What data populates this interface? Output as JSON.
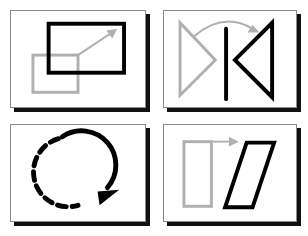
{
  "diagram": {
    "layout": "2x2 grid of framed panels with drop shadows",
    "colors": {
      "original": "#b0b0b0",
      "transformed": "#000000",
      "frame": "#8a8a8a",
      "shadow": "#111111",
      "background": "#ffffff"
    },
    "panels": [
      {
        "id": "translation",
        "description": "Gray rectangle moved up-right into black rectangle, gray arrow shows direction"
      },
      {
        "id": "reflection",
        "description": "Gray triangle reflected across a black vertical line into black triangle, curved gray arrow"
      },
      {
        "id": "rotation",
        "description": "Circular arrow, dashed on the left half and solid on the right, arrowhead at bottom"
      },
      {
        "id": "shear",
        "description": "Gray upright rectangle sheared into black parallelogram, gray arrow pointing right"
      }
    ]
  }
}
